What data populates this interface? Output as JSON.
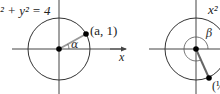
{
  "left_diagram": {
    "equation_label": "x² + y² = 4",
    "equation_visible": "² + y² = 4",
    "point_label": "(a, 1)",
    "angle_label": "α",
    "axis_label_x": "x"
  },
  "right_diagram": {
    "equation_visible": "x²",
    "angle_label": "β",
    "point_label_visible": "(½"
  },
  "colors": {
    "axis": "#333333",
    "circle": "#333333",
    "radius_line": "#999999",
    "point": "#000000"
  }
}
